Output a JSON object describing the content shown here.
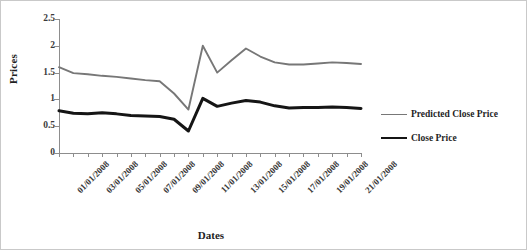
{
  "chart_data": {
    "type": "line",
    "title": "",
    "xlabel": "Dates",
    "ylabel": "Prices",
    "ylim": [
      0,
      2.5
    ],
    "yticks": [
      0,
      0.5,
      1,
      1.5,
      2,
      2.5
    ],
    "ytick_labels": [
      "0",
      "0.5",
      "1",
      "1.5",
      "2",
      "2.5"
    ],
    "grid": false,
    "legend_position": "right",
    "x": [
      "01/01/2008",
      "02/01/2008",
      "03/01/2008",
      "04/01/2008",
      "05/01/2008",
      "06/01/2008",
      "07/01/2008",
      "08/01/2008",
      "09/01/2008",
      "10/01/2008",
      "11/01/2008",
      "12/01/2008",
      "13/01/2008",
      "14/01/2008",
      "15/01/2008",
      "16/01/2008",
      "17/01/2008",
      "18/01/2008",
      "19/01/2008",
      "20/01/2008",
      "21/01/2008",
      "22/01/2008"
    ],
    "xtick_labels": [
      "01/01/2008",
      "03/01/2008",
      "05/01/2008",
      "07/01/2008",
      "09/01/2008",
      "11/01/2008",
      "13/01/2008",
      "15/01/2008",
      "17/01/2008",
      "19/01/2008",
      "21/01/2008"
    ],
    "xtick_indices": [
      0,
      2,
      4,
      6,
      8,
      10,
      12,
      14,
      16,
      18,
      20
    ],
    "series": [
      {
        "name": "Predicted Close Price",
        "color": "#777777",
        "width": 1.9,
        "values": [
          1.6,
          1.49,
          1.47,
          1.44,
          1.42,
          1.39,
          1.36,
          1.34,
          1.11,
          0.81,
          2.0,
          1.5,
          1.73,
          1.95,
          1.8,
          1.69,
          1.65,
          1.65,
          1.67,
          1.69,
          1.68,
          1.66
        ]
      },
      {
        "name": "Close Price",
        "color": "#151515",
        "width": 3.0,
        "values": [
          0.79,
          0.74,
          0.73,
          0.75,
          0.73,
          0.7,
          0.69,
          0.68,
          0.63,
          0.41,
          1.02,
          0.87,
          0.93,
          0.98,
          0.95,
          0.88,
          0.84,
          0.85,
          0.85,
          0.86,
          0.85,
          0.83
        ]
      }
    ]
  },
  "legend": {
    "items": [
      {
        "label": "Predicted Close Price"
      },
      {
        "label": "Close Price"
      }
    ]
  }
}
